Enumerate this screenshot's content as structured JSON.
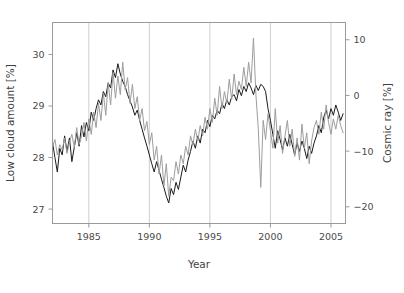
{
  "chart_data": {
    "type": "line",
    "title": "",
    "xlabel": "Year",
    "ylabel": "Low cloud amount [%]",
    "y2label": "Cosmic ray [%]",
    "xlim": [
      1982.0,
      2006.2
    ],
    "ylim": [
      26.72,
      30.62
    ],
    "y2lim": [
      -23.0,
      13.1
    ],
    "xticks": [
      1985,
      1990,
      1995,
      2000,
      2005
    ],
    "xticklabels": [
      "1985",
      "1990",
      "1995",
      "2000",
      "2005"
    ],
    "yticks": [
      27,
      28,
      29,
      30
    ],
    "yticklabels": [
      "27",
      "28",
      "29",
      "30"
    ],
    "y2ticks": [
      -20,
      -10,
      0,
      10
    ],
    "y2ticklabels": [
      "−20",
      "−10",
      "0",
      "10"
    ],
    "grid": "vertical-only-at-xticks",
    "legend": "none",
    "series": [
      {
        "name": "Low cloud amount",
        "axis": "left",
        "color": "#1a1a1a",
        "linewidth": 1.0,
        "units": "%",
        "x": [
          1982.0,
          1982.2,
          1982.4,
          1982.6,
          1982.8,
          1983.0,
          1983.2,
          1983.4,
          1983.6,
          1983.8,
          1984.0,
          1984.2,
          1984.4,
          1984.6,
          1984.8,
          1985.0,
          1985.2,
          1985.4,
          1985.6,
          1985.8,
          1986.0,
          1986.2,
          1986.4,
          1986.6,
          1986.8,
          1987.0,
          1987.2,
          1987.4,
          1987.6,
          1987.8,
          1988.0,
          1988.2,
          1988.4,
          1988.6,
          1988.8,
          1989.0,
          1989.2,
          1989.4,
          1989.6,
          1989.8,
          1990.0,
          1990.2,
          1990.4,
          1990.6,
          1990.8,
          1991.0,
          1991.2,
          1991.4,
          1991.6,
          1991.8,
          1992.0,
          1992.2,
          1992.4,
          1992.6,
          1992.8,
          1993.0,
          1993.2,
          1993.4,
          1993.6,
          1993.8,
          1994.0,
          1994.2,
          1994.4,
          1994.6,
          1994.8,
          1995.0,
          1995.2,
          1995.4,
          1995.6,
          1995.8,
          1996.0,
          1996.2,
          1996.4,
          1996.6,
          1996.8,
          1997.0,
          1997.2,
          1997.4,
          1997.6,
          1997.8,
          1998.0,
          1998.2,
          1998.4,
          1998.6,
          1998.8,
          1999.0,
          1999.2,
          1999.4,
          1999.6,
          1999.8,
          2000.0,
          2000.2,
          2000.4,
          2000.6,
          2000.8,
          2001.0,
          2001.2,
          2001.4,
          2001.6,
          2001.8,
          2002.0,
          2002.2,
          2002.4,
          2002.6,
          2002.8,
          2003.0,
          2003.2,
          2003.4,
          2003.6,
          2003.8,
          2004.0,
          2004.2,
          2004.4,
          2004.6,
          2004.8,
          2005.0,
          2005.2,
          2005.4,
          2005.6,
          2005.8,
          2006.0
        ],
        "y": [
          28.3,
          28.0,
          27.72,
          28.18,
          28.05,
          28.42,
          28.12,
          28.38,
          27.92,
          28.2,
          28.48,
          28.22,
          28.62,
          28.4,
          28.68,
          28.52,
          28.88,
          28.72,
          28.95,
          29.12,
          29.02,
          29.28,
          29.18,
          29.45,
          29.35,
          29.7,
          29.55,
          29.82,
          29.62,
          29.48,
          29.38,
          29.22,
          29.1,
          28.98,
          28.82,
          28.92,
          28.72,
          28.55,
          28.38,
          28.22,
          28.05,
          27.88,
          27.72,
          27.92,
          27.75,
          27.58,
          27.42,
          27.25,
          27.12,
          27.4,
          27.28,
          27.52,
          27.38,
          27.62,
          27.85,
          27.72,
          27.95,
          28.12,
          28.32,
          28.18,
          28.42,
          28.28,
          28.55,
          28.48,
          28.72,
          28.6,
          28.82,
          28.75,
          28.92,
          28.85,
          29.05,
          28.95,
          29.12,
          29.02,
          29.18,
          29.22,
          29.1,
          29.32,
          29.2,
          29.38,
          29.28,
          29.45,
          29.35,
          29.22,
          29.4,
          29.3,
          29.42,
          29.38,
          29.28,
          28.95,
          28.72,
          28.45,
          28.18,
          28.52,
          28.35,
          28.15,
          28.38,
          28.22,
          28.45,
          28.25,
          28.05,
          28.28,
          28.12,
          28.32,
          28.18,
          27.98,
          28.22,
          28.08,
          28.28,
          28.42,
          28.62,
          28.48,
          28.78,
          28.92,
          28.75,
          28.95,
          28.82,
          29.02,
          28.88,
          28.72,
          28.85
        ]
      },
      {
        "name": "Cosmic ray",
        "axis": "right",
        "color": "#9d9d9d",
        "linewidth": 1.0,
        "units": "%",
        "x": [
          1982.0,
          1982.2,
          1982.4,
          1982.6,
          1982.8,
          1983.0,
          1983.2,
          1983.4,
          1983.6,
          1983.8,
          1984.0,
          1984.2,
          1984.4,
          1984.6,
          1984.8,
          1985.0,
          1985.2,
          1985.4,
          1985.6,
          1985.8,
          1986.0,
          1986.2,
          1986.4,
          1986.6,
          1986.8,
          1987.0,
          1987.2,
          1987.4,
          1987.6,
          1987.8,
          1988.0,
          1988.2,
          1988.4,
          1988.6,
          1988.8,
          1989.0,
          1989.2,
          1989.4,
          1989.6,
          1989.8,
          1990.0,
          1990.2,
          1990.4,
          1990.6,
          1990.8,
          1991.0,
          1991.2,
          1991.4,
          1991.6,
          1991.8,
          1992.0,
          1992.2,
          1992.4,
          1992.6,
          1992.8,
          1993.0,
          1993.2,
          1993.4,
          1993.6,
          1993.8,
          1994.0,
          1994.2,
          1994.4,
          1994.6,
          1994.8,
          1995.0,
          1995.2,
          1995.4,
          1995.6,
          1995.8,
          1996.0,
          1996.2,
          1996.4,
          1996.6,
          1996.8,
          1997.0,
          1997.2,
          1997.4,
          1997.6,
          1997.8,
          1998.0,
          1998.2,
          1998.4,
          1998.6,
          1998.8,
          1999.0,
          1999.2,
          1999.4,
          1999.6,
          1999.8,
          2000.0,
          2000.2,
          2000.4,
          2000.6,
          2000.8,
          2001.0,
          2001.2,
          2001.4,
          2001.6,
          2001.8,
          2002.0,
          2002.2,
          2002.4,
          2002.6,
          2002.8,
          2003.0,
          2003.2,
          2003.4,
          2003.6,
          2003.8,
          2004.0,
          2004.2,
          2004.4,
          2004.6,
          2004.8,
          2005.0,
          2005.2,
          2005.4,
          2005.6,
          2005.8,
          2006.0
        ],
        "y_as_cloud": [
          28.2,
          28.35,
          28.05,
          28.25,
          28.15,
          28.38,
          28.08,
          28.3,
          28.45,
          28.2,
          28.58,
          28.25,
          28.42,
          28.68,
          28.32,
          28.75,
          28.45,
          28.88,
          28.58,
          29.05,
          28.72,
          29.25,
          28.82,
          29.45,
          29.02,
          29.65,
          29.15,
          29.58,
          29.22,
          29.85,
          29.32,
          29.55,
          29.05,
          29.42,
          28.95,
          29.18,
          28.72,
          28.95,
          28.52,
          28.7,
          28.25,
          28.48,
          27.95,
          28.22,
          27.68,
          28.05,
          27.45,
          27.88,
          27.25,
          27.62,
          27.55,
          27.92,
          27.68,
          28.05,
          27.88,
          28.22,
          28.05,
          28.42,
          28.25,
          28.55,
          28.32,
          28.62,
          28.42,
          28.78,
          28.55,
          28.95,
          28.68,
          29.15,
          28.82,
          29.38,
          28.95,
          29.28,
          29.05,
          29.52,
          29.12,
          29.62,
          29.22,
          29.48,
          29.32,
          29.75,
          29.38,
          29.85,
          29.45,
          30.32,
          29.22,
          28.55,
          27.42,
          28.72,
          28.35,
          28.85,
          28.52,
          28.18,
          28.95,
          28.28,
          28.62,
          28.08,
          28.42,
          28.72,
          28.22,
          28.55,
          28.02,
          28.38,
          27.95,
          28.65,
          28.18,
          28.48,
          27.88,
          28.32,
          28.58,
          28.72,
          28.45,
          28.88,
          28.55,
          29.02,
          28.68,
          28.45,
          28.75,
          28.55,
          28.82,
          28.62,
          28.48
        ]
      }
    ]
  }
}
